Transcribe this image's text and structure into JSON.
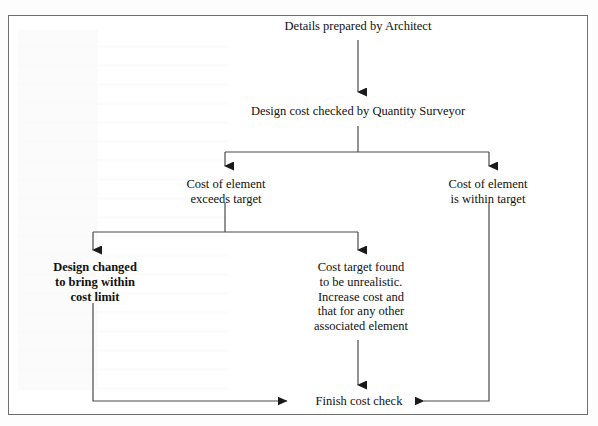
{
  "page": {
    "background_color": "#ffffff",
    "border_color": "#6e6e6e",
    "text_color": "#111111"
  },
  "flowchart": {
    "type": "flowchart",
    "orientation": "top-down",
    "nodes": [
      {
        "id": "details",
        "label": "Details prepared by Architect",
        "emphasis": "normal"
      },
      {
        "id": "check",
        "label": "Design cost checked by Quantity Surveyor",
        "emphasis": "normal"
      },
      {
        "id": "exceeds",
        "label": "Cost of element\nexceeds target",
        "emphasis": "normal"
      },
      {
        "id": "within",
        "label": "Cost of element\nis within target",
        "emphasis": "normal"
      },
      {
        "id": "design",
        "label": "Design changed\nto bring within\ncost limit",
        "emphasis": "bold"
      },
      {
        "id": "unreal",
        "label": "Cost target found\nto be unrealistic.\nIncrease cost and\nthat for any other\nassociated element",
        "emphasis": "normal"
      },
      {
        "id": "finish",
        "label": "Finish cost check",
        "emphasis": "normal"
      }
    ],
    "edges": [
      {
        "from": "details",
        "to": "check",
        "style": "straight-down",
        "arrow": true
      },
      {
        "from": "check",
        "to": "exceeds",
        "style": "split-left",
        "arrow": true
      },
      {
        "from": "check",
        "to": "within",
        "style": "split-right",
        "arrow": true
      },
      {
        "from": "exceeds",
        "to": "design",
        "style": "split-left",
        "arrow": true
      },
      {
        "from": "exceeds",
        "to": "unreal",
        "style": "split-right",
        "arrow": true
      },
      {
        "from": "design",
        "to": "finish",
        "style": "down-then-right",
        "arrow": true
      },
      {
        "from": "unreal",
        "to": "finish",
        "style": "straight-down",
        "arrow": true
      },
      {
        "from": "within",
        "to": "finish",
        "style": "down-then-left",
        "arrow": true
      }
    ]
  }
}
